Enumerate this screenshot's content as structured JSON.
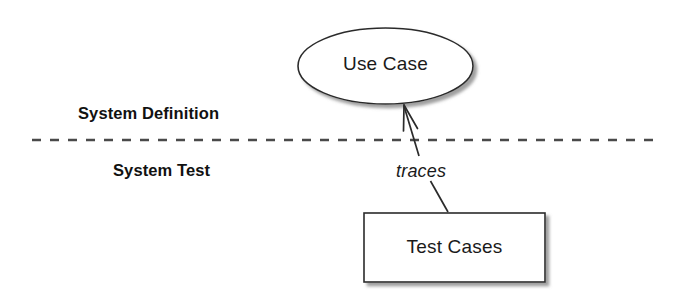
{
  "diagram": {
    "background_color": "#ffffff",
    "stroke_color": "#2b2b2b",
    "shadow_color": "#9a9a9a",
    "text_color": "#1a1a1a",
    "nodes": [
      {
        "id": "use-case",
        "shape": "ellipse",
        "label": "Use Case",
        "cx": 385.5,
        "cy": 66,
        "rx": 87.5,
        "ry": 38,
        "fill": "#ffffff",
        "stroke": "#2b2b2b"
      },
      {
        "id": "test-cases",
        "shape": "rectangle",
        "label": "Test Cases",
        "x": 364,
        "y": 213,
        "width": 181,
        "height": 69,
        "fill": "#ffffff",
        "stroke": "#2b2b2b"
      }
    ],
    "edges": [
      {
        "id": "traces-edge",
        "label": "traces",
        "from": "test-cases",
        "to": "use-case",
        "style": "solid",
        "arrowhead": "open",
        "label_style": "italic"
      }
    ],
    "swimlanes": {
      "divider": {
        "style": "dashed",
        "y": 140,
        "x_start": 32,
        "x_end": 655,
        "color": "#4a4a4a"
      },
      "upper_label": "System Definition",
      "lower_label": "System Test"
    }
  }
}
